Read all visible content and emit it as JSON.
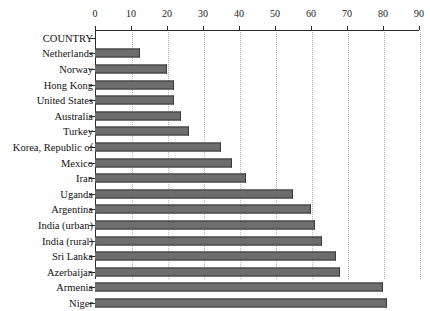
{
  "chart_data": {
    "type": "bar",
    "orientation": "horizontal",
    "title": "",
    "subtitle": "",
    "xlabel": "",
    "ylabel": "",
    "xlim": [
      0,
      90
    ],
    "ylim": null,
    "grid": true,
    "grid_axis": "x",
    "legend": null,
    "legend_position": "none",
    "axis_position": "top",
    "categories": [
      "COUNTRY",
      "Netherlands",
      "Norway",
      "Hong Kong",
      "United States",
      "Australia",
      "Turkey",
      "Korea, Republic of",
      "Mexico",
      "Iran",
      "Uganda",
      "Argentina",
      "India (urban)",
      "India (rural)",
      "Sri Lanka",
      "Azerbaijan",
      "Armenia",
      "Niger"
    ],
    "values": [
      0,
      12.5,
      20,
      22,
      22,
      24,
      26,
      35,
      38,
      42,
      55,
      60,
      61,
      63,
      67,
      68,
      80,
      81
    ],
    "xticks": [
      0,
      10,
      20,
      30,
      40,
      50,
      60,
      70,
      80,
      90
    ],
    "xtick_labels": [
      "0",
      "10",
      "20",
      "30",
      "40",
      "50",
      "60",
      "70",
      "80",
      "90"
    ],
    "colors": {
      "bar_fill": "#6d6d6d",
      "bar_edge": "#3a3a3a",
      "axis": "#2b2b2b",
      "grid": "#b9b9a9",
      "background": "#ffffff",
      "text": "#111111"
    }
  }
}
